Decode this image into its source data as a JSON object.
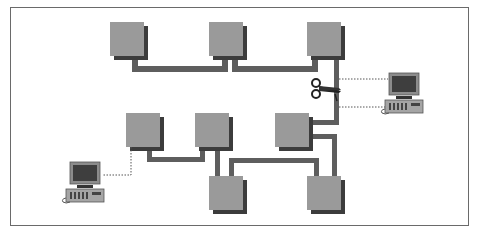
{
  "diagram": {
    "colors": {
      "box_fill": "#9a9a9a",
      "box_shadow": "#3c3c3c",
      "cable": "#5e5e5e",
      "dotted_link": "#555555",
      "frame_border": "#6a6a6a"
    },
    "nodes": [
      {
        "id": "hub-1",
        "type": "hub",
        "x": 110,
        "y": 22
      },
      {
        "id": "hub-2",
        "type": "hub",
        "x": 209,
        "y": 22
      },
      {
        "id": "hub-3",
        "type": "hub",
        "x": 307,
        "y": 22
      },
      {
        "id": "hub-4",
        "type": "hub",
        "x": 126,
        "y": 113
      },
      {
        "id": "hub-5",
        "type": "hub",
        "x": 195,
        "y": 113
      },
      {
        "id": "hub-6",
        "type": "hub",
        "x": 275,
        "y": 113
      },
      {
        "id": "hub-7",
        "type": "hub",
        "x": 209,
        "y": 176
      },
      {
        "id": "hub-8",
        "type": "hub",
        "x": 307,
        "y": 176
      },
      {
        "id": "workstation-1",
        "type": "computer",
        "x": 385,
        "y": 73
      },
      {
        "id": "workstation-2",
        "type": "computer",
        "x": 62,
        "y": 162
      }
    ],
    "annotations": [
      {
        "id": "cable-cut",
        "type": "scissors-icon",
        "x": 322,
        "y": 88
      }
    ]
  }
}
